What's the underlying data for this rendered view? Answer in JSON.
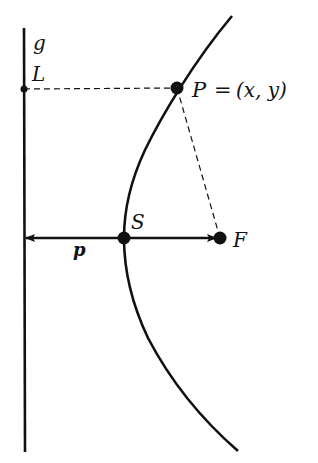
{
  "colors": {
    "stroke": "#111111",
    "background": "#ffffff"
  },
  "labels": {
    "directrix": "g",
    "foot_point": "L",
    "point": "P",
    "point_eq": "=",
    "point_coords": "(x, y)",
    "vertex": "S",
    "focus": "F",
    "parameter": "p"
  },
  "elements": {
    "directrix": "vertical line g",
    "parabola": "curve opening to the right",
    "segment_PL": "dashed horizontal from P to L",
    "segment_PF": "dashed from P to F",
    "axis_arrows": "double arrow from directrix through S to F, length p"
  }
}
